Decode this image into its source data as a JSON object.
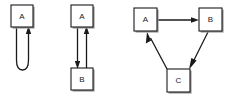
{
  "figure": {
    "background_color": "#ffffff",
    "line_color": "#1a1a1a",
    "box_fill_color": "#ffffff",
    "shadow_color": "#9a9a9a",
    "panels": [
      {
        "id": "panel-self-loop",
        "name": "self-loop",
        "nodes": [
          {
            "id": "a",
            "label": "A",
            "x": 11,
            "y": 5,
            "w": 22,
            "h": 22
          }
        ],
        "edges": [
          {
            "id": "a-a",
            "from": "A",
            "to": "A",
            "kind": "self-loop",
            "direction": "into-bottom"
          }
        ]
      },
      {
        "id": "panel-two-cycle",
        "name": "two-node-cycle",
        "nodes": [
          {
            "id": "a",
            "label": "A",
            "x": 71,
            "y": 5,
            "w": 22,
            "h": 22
          },
          {
            "id": "b",
            "label": "B",
            "x": 71,
            "y": 68,
            "w": 22,
            "h": 22
          }
        ],
        "edges": [
          {
            "id": "a-b",
            "from": "A",
            "to": "B",
            "kind": "straight",
            "direction": "down"
          },
          {
            "id": "b-a",
            "from": "B",
            "to": "A",
            "kind": "straight",
            "direction": "up"
          }
        ]
      },
      {
        "id": "panel-three-cycle",
        "name": "three-node-cycle",
        "nodes": [
          {
            "id": "a",
            "label": "A",
            "x": 134,
            "y": 8,
            "w": 24,
            "h": 24
          },
          {
            "id": "b",
            "label": "B",
            "x": 199,
            "y": 8,
            "w": 24,
            "h": 24
          },
          {
            "id": "c",
            "label": "C",
            "x": 167,
            "y": 69,
            "w": 24,
            "h": 24
          }
        ],
        "edges": [
          {
            "id": "a-b",
            "from": "A",
            "to": "B",
            "kind": "straight",
            "direction": "right"
          },
          {
            "id": "b-c",
            "from": "B",
            "to": "C",
            "kind": "straight",
            "direction": "down-left"
          },
          {
            "id": "c-a",
            "from": "C",
            "to": "A",
            "kind": "straight",
            "direction": "up-left"
          }
        ]
      }
    ]
  },
  "labels": {
    "panel1_node_a": "A",
    "panel2_node_a": "A",
    "panel2_node_b": "B",
    "panel3_node_a": "A",
    "panel3_node_b": "B",
    "panel3_node_c": "C"
  }
}
